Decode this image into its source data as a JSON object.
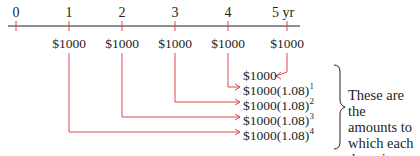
{
  "timeline": {
    "ticks": [
      {
        "label": "0",
        "x": 16
      },
      {
        "label": "1",
        "x": 69
      },
      {
        "label": "2",
        "x": 122
      },
      {
        "label": "3",
        "x": 175
      },
      {
        "label": "4",
        "x": 228
      },
      {
        "label": "5 yr",
        "x": 287
      }
    ],
    "deposits": [
      {
        "label": "$1000",
        "x": 69
      },
      {
        "label": "$1000",
        "x": 122
      },
      {
        "label": "$1000",
        "x": 175
      },
      {
        "label": "$1000",
        "x": 228
      },
      {
        "label": "$1000",
        "x": 287
      }
    ]
  },
  "future_values": [
    {
      "base": "$1000",
      "exp": ""
    },
    {
      "base": "$1000(1.08)",
      "exp": "1"
    },
    {
      "base": "$1000(1.08)",
      "exp": "2"
    },
    {
      "base": "$1000(1.08)",
      "exp": "3"
    },
    {
      "base": "$1000(1.08)",
      "exp": "4"
    }
  ],
  "note": {
    "lines": [
      "These are the",
      "amounts to",
      "which each",
      "deposit grows."
    ]
  },
  "colors": {
    "accent": "#e0474c",
    "text": "#231f20",
    "axis": "#231f20"
  }
}
